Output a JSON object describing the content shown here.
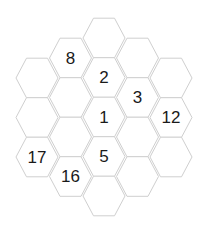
{
  "puzzle": {
    "type": "hex-grid-number-puzzle",
    "colors": {
      "cell_fill": "#ffffff",
      "cell_stroke": "#cfcfcf",
      "text": "#1a1a1a"
    },
    "cells": [
      {
        "col": 0,
        "row": 0,
        "value": ""
      },
      {
        "col": 0,
        "row": 1,
        "value": ""
      },
      {
        "col": 0,
        "row": 2,
        "value": "17"
      },
      {
        "col": 1,
        "row": 0,
        "value": "8"
      },
      {
        "col": 1,
        "row": 1,
        "value": ""
      },
      {
        "col": 1,
        "row": 2,
        "value": ""
      },
      {
        "col": 1,
        "row": 3,
        "value": "16"
      },
      {
        "col": 2,
        "row": 0,
        "value": ""
      },
      {
        "col": 2,
        "row": 1,
        "value": "2"
      },
      {
        "col": 2,
        "row": 2,
        "value": "1"
      },
      {
        "col": 2,
        "row": 3,
        "value": "5"
      },
      {
        "col": 2,
        "row": 4,
        "value": ""
      },
      {
        "col": 3,
        "row": 0,
        "value": ""
      },
      {
        "col": 3,
        "row": 1,
        "value": "3"
      },
      {
        "col": 3,
        "row": 2,
        "value": ""
      },
      {
        "col": 3,
        "row": 3,
        "value": ""
      },
      {
        "col": 4,
        "row": 0,
        "value": ""
      },
      {
        "col": 4,
        "row": 1,
        "value": "12"
      },
      {
        "col": 4,
        "row": 2,
        "value": ""
      }
    ]
  }
}
